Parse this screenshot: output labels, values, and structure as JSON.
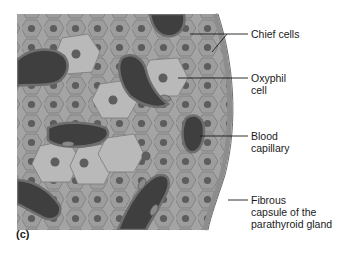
{
  "figure": {
    "panel_label": "(c)",
    "labels": {
      "chief_cells": "Chief cells",
      "oxyphil_cell": "Oxyphil\ncell",
      "blood_capillary": "Blood\ncapillary",
      "fibrous_capsule": "Fibrous\ncapsule of the\nparathyroid gland"
    },
    "colors": {
      "tissue": "#a6a6a6",
      "cell_border": "#7d7d7d",
      "chief_cell": "#9c9c9c",
      "oxyphil_cell": "#b8b8b8",
      "nucleus": "#5a5a5a",
      "capillary": "#3c3c3c",
      "capsule": "#8a8a8a",
      "leader": "#1a1a1a"
    }
  }
}
